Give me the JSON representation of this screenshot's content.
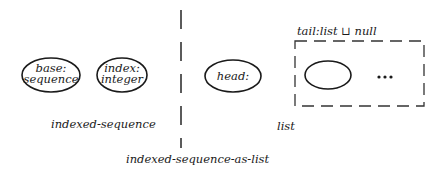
{
  "diagram": {
    "left": {
      "caption": "indexed-sequence",
      "nodes": [
        {
          "line1": "base:",
          "line2": "sequence"
        },
        {
          "line1": "index:",
          "line2": "integer"
        }
      ]
    },
    "right": {
      "caption": "list",
      "head": {
        "label": "head:"
      },
      "tail": {
        "label": "tail:list ⊔ null",
        "ellipsis": "•••"
      }
    },
    "bottom_caption": "indexed-sequence-as-list",
    "colors": {
      "stroke": "#1a1a1a",
      "background": "#ffffff"
    }
  }
}
